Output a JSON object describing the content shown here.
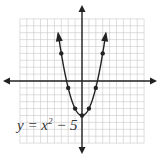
{
  "chart_data": {
    "type": "line",
    "title": "",
    "equation_label": "y = x² − 5",
    "equation": "y=x^2-5",
    "xlabel": "",
    "ylabel": "",
    "xlim": [
      -9,
      9
    ],
    "ylim": [
      -9,
      9
    ],
    "grid": true,
    "series": [
      {
        "name": "y = x^2 - 5",
        "points": [
          {
            "x": -3,
            "y": 4
          },
          {
            "x": -2,
            "y": -1
          },
          {
            "x": -1,
            "y": -4
          },
          {
            "x": 0,
            "y": -5
          },
          {
            "x": 1,
            "y": -4
          },
          {
            "x": 2,
            "y": -1
          },
          {
            "x": 3,
            "y": 4
          }
        ],
        "arrows_at_ends": true
      }
    ],
    "axes_arrows": true
  },
  "colors": {
    "grid": "#c8c8c8",
    "axis": "#222222",
    "curve": "#222222"
  }
}
